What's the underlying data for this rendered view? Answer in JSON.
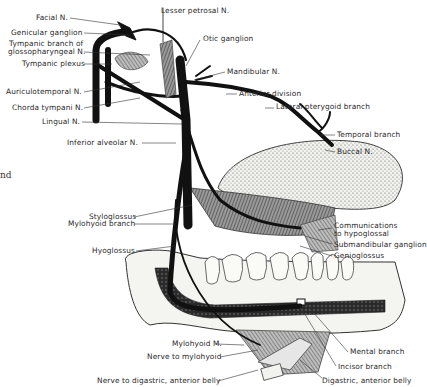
{
  "figure": {
    "left_fragment_text": "nd",
    "colors": {
      "nerve": "#111111",
      "label": "#2a2a2a",
      "bone": "#f4f4f0",
      "shading": "#6a6a6a",
      "background": "#ffffff"
    }
  },
  "labels_left": [
    {
      "id": "facial-n",
      "text": "Facial N.",
      "x": 36,
      "y": 14
    },
    {
      "id": "geniculate-ganglion",
      "text": "Genicular ganglion",
      "x": 11,
      "y": 29
    },
    {
      "id": "tympanic-branch-1",
      "text": "Tympanic branch of",
      "x": 9,
      "y": 40
    },
    {
      "id": "tympanic-branch-2",
      "text": "glossopharyngeal N.",
      "x": 8,
      "y": 49
    },
    {
      "id": "tympanic-plexus",
      "text": "Tympanic plexus",
      "x": 22,
      "y": 61
    },
    {
      "id": "auriculotemporal-n",
      "text": "Auriculotemporal N.",
      "x": 6,
      "y": 89
    },
    {
      "id": "chorda-tympani-n",
      "text": "Chorda tympani N.",
      "x": 12,
      "y": 105
    },
    {
      "id": "lingual-n",
      "text": "Lingual N.",
      "x": 42,
      "y": 119
    },
    {
      "id": "inferior-alveolar-n",
      "text": "Inferior alveolar N.",
      "x": 67,
      "y": 141
    },
    {
      "id": "styloglossus",
      "text": "Styloglossus",
      "x": 89,
      "y": 214
    },
    {
      "id": "mylohyoid-branch",
      "text": "Mylohyoid branch",
      "x": 68,
      "y": 221
    },
    {
      "id": "hyoglossus",
      "text": "Hyoglossus",
      "x": 92,
      "y": 248
    },
    {
      "id": "mylohyoid-m",
      "text": "Mylohyoid M.",
      "x": 172,
      "y": 341
    },
    {
      "id": "nerve-to-mylohyoid",
      "text": "Nerve to mylohyoid",
      "x": 147,
      "y": 354
    },
    {
      "id": "nerve-to-digastric",
      "text": "Nerve to digastric, anterior belly",
      "x": 97,
      "y": 378
    }
  ],
  "labels_right": [
    {
      "id": "lesser-petrosal-n",
      "text": "Lesser petrosal N.",
      "x": 161,
      "y": 9
    },
    {
      "id": "otic-ganglion",
      "text": "Otic ganglion",
      "x": 203,
      "y": 36
    },
    {
      "id": "mandibular-n",
      "text": "Mandibular N.",
      "x": 227,
      "y": 69
    },
    {
      "id": "anterior-division",
      "text": "Anterior division",
      "x": 239,
      "y": 91
    },
    {
      "id": "lateral-pterygoid-branch",
      "text": "Lateral pterygoid branch",
      "x": 276,
      "y": 104
    },
    {
      "id": "temporal-branch",
      "text": "Temporal branch",
      "x": 337,
      "y": 132
    },
    {
      "id": "buccal-n",
      "text": "Buccal N.",
      "x": 337,
      "y": 149
    },
    {
      "id": "communications-1",
      "text": "Communications",
      "x": 334,
      "y": 222
    },
    {
      "id": "communications-2",
      "text": "to hypoglossal",
      "x": 334,
      "y": 230
    },
    {
      "id": "submandibular-ganglion",
      "text": "Submandibular ganglion",
      "x": 334,
      "y": 241
    },
    {
      "id": "genioglossus",
      "text": "Genioglossus",
      "x": 334,
      "y": 253
    },
    {
      "id": "mental-branch",
      "text": "Mental branch",
      "x": 350,
      "y": 349
    },
    {
      "id": "incisor-branch",
      "text": "Incisor branch",
      "x": 338,
      "y": 364
    },
    {
      "id": "digastric-anterior-belly",
      "text": "Digastric, anterior belly",
      "x": 322,
      "y": 378
    }
  ]
}
